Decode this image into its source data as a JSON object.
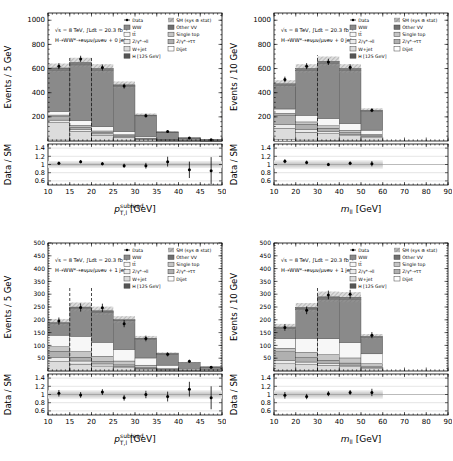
{
  "figure": {
    "background": "#ffffff",
    "ratio_ylabel": "Data / SM",
    "ratio_tick_labels": [
      "0.6",
      "0.8",
      "1",
      "1.2",
      "1.4"
    ],
    "legend": {
      "columns": [
        [
          {
            "label": "Data",
            "swatch": "marker"
          },
          {
            "label": "WW",
            "swatch": "#8a8a8a"
          },
          {
            "label": "tt̄",
            "swatch": "#f7f7f7"
          },
          {
            "label": "Z/γ*→ll",
            "swatch": "#ebebeb"
          },
          {
            "label": "W+jet",
            "swatch": "#dcdcdc"
          },
          {
            "label": "H [125 GeV]",
            "swatch": "#555555"
          }
        ],
        [
          {
            "label": "SM (sys ⊕ stat)",
            "swatch": "band"
          },
          {
            "label": "Other VV",
            "swatch": "#6f6f6f"
          },
          {
            "label": "Single top",
            "swatch": "#c6c6c6"
          },
          {
            "label": "Z/γ*→ττ",
            "swatch": "#b0b0b0"
          },
          {
            "label": "Dijet",
            "swatch": "#ffffff"
          }
        ]
      ]
    }
  },
  "chart_data": [
    {
      "id": "pt-sublead-0jet",
      "type": "bar",
      "title": "",
      "info_line1": "√s = 8 TeV,  ∫Ldt = 20.3 fb⁻¹",
      "info_line2": "H→WW*→eνμν/μνeν + 0 jets",
      "ylabel": "Events / 5 GeV",
      "xlabel": {
        "base": "p",
        "sup": "sublead",
        "sub": "T,l",
        "unit": "[GeV]"
      },
      "x": {
        "min": 10,
        "max": 50,
        "tick_labels": [
          10,
          15,
          20,
          25,
          30,
          35,
          40,
          45,
          50
        ],
        "minor_step": 1
      },
      "y": {
        "max": 1060,
        "tick_labels": [
          200,
          400,
          600,
          800,
          1000
        ],
        "minor_step": 40
      },
      "bin_edges": [
        10,
        15,
        20,
        25,
        30,
        35,
        40,
        45,
        50
      ],
      "stack": [
        {
          "name": "Dijet",
          "color": "#ffffff",
          "values": [
            8,
            5,
            4,
            3,
            1,
            0.5,
            0.3,
            0.2
          ]
        },
        {
          "name": "W+jet",
          "color": "#dcdcdc",
          "values": [
            145,
            75,
            45,
            28,
            12,
            5,
            2,
            1
          ]
        },
        {
          "name": "Z/γ*→ll",
          "color": "#ebebeb",
          "values": [
            20,
            15,
            10,
            6,
            3,
            1,
            0.5,
            0.2
          ]
        },
        {
          "name": "Z/γ*→ττ",
          "color": "#b0b0b0",
          "values": [
            30,
            20,
            12,
            8,
            4,
            1.5,
            0.7,
            0.3
          ]
        },
        {
          "name": "Single top",
          "color": "#c6c6c6",
          "values": [
            12,
            15,
            12,
            8,
            4,
            1.5,
            0.5,
            0.3
          ]
        },
        {
          "name": "tt̄",
          "color": "#f7f7f7",
          "values": [
            30,
            40,
            35,
            25,
            12,
            4,
            2,
            1
          ]
        },
        {
          "name": "WW",
          "color": "#8a8a8a",
          "values": [
            340,
            460,
            465,
            375,
            172,
            59,
            19,
            8.6
          ]
        },
        {
          "name": "Other VV",
          "color": "#6f6f6f",
          "values": [
            18,
            18,
            15,
            10,
            6,
            2,
            1,
            0.4
          ]
        },
        {
          "name": "H [125 GeV]",
          "color": "#555555",
          "values": [
            2,
            2,
            2,
            2,
            1,
            0.5,
            0,
            0
          ]
        }
      ],
      "sm_total": [
        605,
        650,
        600,
        465,
        215,
        75,
        26,
        12
      ],
      "band_frac": 0.06,
      "data": {
        "x": [
          12.5,
          17.5,
          22.5,
          27.5,
          32.5,
          37.5,
          42.5,
          47.5
        ],
        "y": [
          620,
          680,
          608,
          455,
          210,
          78,
          25,
          10
        ],
        "err": [
          25,
          26,
          25,
          21,
          15,
          9,
          5,
          3.2
        ]
      },
      "ratio": {
        "y": [
          1.03,
          1.07,
          1.02,
          0.97,
          0.97,
          1.07,
          0.87,
          0.85
        ],
        "err": [
          0.04,
          0.04,
          0.04,
          0.05,
          0.07,
          0.12,
          0.2,
          0.33
        ],
        "band": {
          "xmin": 10,
          "xmax": 50,
          "outer": 0.08,
          "inner": 0.04
        }
      },
      "cut_lines": [
        {
          "x": 15,
          "ytop": 700
        },
        {
          "x": 20,
          "ytop": 700
        }
      ]
    },
    {
      "id": "mll-0jet",
      "type": "bar",
      "title": "",
      "info_line1": "√s = 8 TeV,  ∫Ldt = 20.3 fb⁻¹",
      "info_line2": "H→WW*→eνμν/μνeν + 0 jets",
      "ylabel": "Events / 10 GeV",
      "xlabel": {
        "base": "m",
        "sub": "ll",
        "unit": "[GeV]"
      },
      "x": {
        "min": 10,
        "max": 90,
        "tick_labels": [
          10,
          20,
          30,
          40,
          50,
          60,
          70,
          80,
          90
        ],
        "minor_step": 2
      },
      "y": {
        "max": 1060,
        "tick_labels": [
          200,
          400,
          600,
          800,
          1000
        ],
        "minor_step": 40
      },
      "bin_edges": [
        10,
        20,
        30,
        40,
        50,
        60
      ],
      "stack": [
        {
          "name": "Dijet",
          "color": "#ffffff",
          "values": [
            10,
            8,
            6,
            4,
            2
          ]
        },
        {
          "name": "W+jet",
          "color": "#dcdcdc",
          "values": [
            95,
            65,
            55,
            40,
            25
          ]
        },
        {
          "name": "Z/γ*→ll",
          "color": "#ebebeb",
          "values": [
            30,
            25,
            20,
            12,
            8
          ]
        },
        {
          "name": "Z/γ*→ττ",
          "color": "#b0b0b0",
          "values": [
            80,
            40,
            25,
            15,
            8
          ]
        },
        {
          "name": "Single top",
          "color": "#c6c6c6",
          "values": [
            15,
            20,
            20,
            18,
            12
          ]
        },
        {
          "name": "tt̄",
          "color": "#f7f7f7",
          "values": [
            35,
            55,
            60,
            55,
            35
          ]
        },
        {
          "name": "WW",
          "color": "#8a8a8a",
          "values": [
            195,
            370,
            455,
            440,
            155
          ]
        },
        {
          "name": "Other VV",
          "color": "#6f6f6f",
          "values": [
            15,
            15,
            17,
            14,
            8
          ]
        },
        {
          "name": "H [125 GeV]",
          "color": "#555555",
          "values": [
            0,
            2,
            2,
            2,
            2
          ]
        }
      ],
      "sm_total": [
        475,
        600,
        660,
        600,
        255
      ],
      "band_frac": 0.06,
      "data": {
        "x": [
          15,
          25,
          35,
          45,
          55
        ],
        "y": [
          510,
          620,
          655,
          610,
          255
        ],
        "err": [
          23,
          25,
          26,
          25,
          16
        ]
      },
      "ratio": {
        "y": [
          1.08,
          1.05,
          1.0,
          1.03,
          1.02
        ],
        "err": [
          0.05,
          0.045,
          0.04,
          0.045,
          0.065
        ],
        "band": {
          "xmin": 10,
          "xmax": 60,
          "outer": 0.1,
          "inner": 0.05
        }
      },
      "cut_lines": [
        {
          "x": 30,
          "ytop": 710
        }
      ]
    },
    {
      "id": "pt-sublead-1jet",
      "type": "bar",
      "title": "",
      "info_line1": "√s = 8 TeV,  ∫Ldt = 20.3 fb⁻¹",
      "info_line2": "H→WW*→eνμν/μνeν + 1 jet",
      "ylabel": "Events / 5 GeV",
      "xlabel": {
        "base": "p",
        "sup": "sublead",
        "sub": "T,l",
        "unit": "[GeV]"
      },
      "x": {
        "min": 10,
        "max": 50,
        "tick_labels": [
          10,
          15,
          20,
          25,
          30,
          35,
          40,
          45,
          50
        ],
        "minor_step": 1
      },
      "y": {
        "max": 500,
        "tick_labels": [
          50,
          100,
          150,
          200,
          250,
          300,
          350,
          400,
          450,
          500
        ],
        "minor_step": 10
      },
      "bin_edges": [
        10,
        15,
        20,
        25,
        30,
        35,
        40,
        45,
        50
      ],
      "stack": [
        {
          "name": "Dijet",
          "color": "#ffffff",
          "values": [
            2,
            2,
            1.5,
            1,
            0.8,
            0.4,
            0.2,
            0.1
          ]
        },
        {
          "name": "W+jet",
          "color": "#dcdcdc",
          "values": [
            35,
            25,
            18,
            12,
            7,
            3,
            1.5,
            0.8
          ]
        },
        {
          "name": "Z/γ*→ll",
          "color": "#ebebeb",
          "values": [
            15,
            12,
            8,
            5,
            3,
            1,
            0.5,
            0.3
          ]
        },
        {
          "name": "Z/γ*→ττ",
          "color": "#b0b0b0",
          "values": [
            25,
            15,
            10,
            6,
            3,
            1.5,
            0.8,
            0.4
          ]
        },
        {
          "name": "Single top",
          "color": "#c6c6c6",
          "values": [
            18,
            22,
            20,
            15,
            9,
            4,
            2,
            1
          ]
        },
        {
          "name": "tt̄",
          "color": "#f7f7f7",
          "values": [
            45,
            60,
            55,
            45,
            28,
            13,
            6,
            3
          ]
        },
        {
          "name": "WW",
          "color": "#8a8a8a",
          "values": [
            45,
            108,
            117,
            112,
            74,
            43,
            21,
            10
          ]
        },
        {
          "name": "Other VV",
          "color": "#6f6f6f",
          "values": [
            5,
            5,
            5,
            3,
            2.5,
            1.6,
            1,
            0.4
          ]
        },
        {
          "name": "H [125 GeV]",
          "color": "#555555",
          "values": [
            0,
            1,
            0.5,
            1,
            0.7,
            0.5,
            0,
            0
          ]
        }
      ],
      "sm_total": [
        190,
        250,
        235,
        200,
        128,
        68,
        33,
        16
      ],
      "band_frac": 0.07,
      "data": {
        "x": [
          12.5,
          17.5,
          22.5,
          27.5,
          32.5,
          37.5,
          42.5,
          47.5
        ],
        "y": [
          195,
          248,
          247,
          185,
          127,
          65,
          38,
          15
        ],
        "err": [
          14,
          16,
          16,
          14,
          11,
          8,
          6,
          4
        ]
      },
      "ratio": {
        "y": [
          1.03,
          0.99,
          1.06,
          0.92,
          1.0,
          0.95,
          1.13,
          0.92
        ],
        "err": [
          0.08,
          0.07,
          0.07,
          0.07,
          0.09,
          0.12,
          0.18,
          0.28
        ],
        "band": {
          "xmin": 10,
          "xmax": 50,
          "outer": 0.1,
          "inner": 0.05
        }
      },
      "cut_lines": [
        {
          "x": 15,
          "ytop": 325
        },
        {
          "x": 20,
          "ytop": 325
        }
      ]
    },
    {
      "id": "mll-1jet",
      "type": "bar",
      "title": "",
      "info_line1": "√s = 8 TeV,  ∫Ldt = 20.3 fb⁻¹",
      "info_line2": "H→WW*→eνμν/μνeν + 1 jet",
      "ylabel": "Events / 10 GeV",
      "xlabel": {
        "base": "m",
        "sub": "ll",
        "unit": "[GeV]"
      },
      "x": {
        "min": 10,
        "max": 90,
        "tick_labels": [
          10,
          20,
          30,
          40,
          50,
          60,
          70,
          80,
          90
        ],
        "minor_step": 2
      },
      "y": {
        "max": 500,
        "tick_labels": [
          50,
          100,
          150,
          200,
          250,
          300,
          350,
          400,
          450,
          500
        ],
        "minor_step": 10
      },
      "bin_edges": [
        10,
        20,
        30,
        40,
        50,
        60
      ],
      "stack": [
        {
          "name": "Dijet",
          "color": "#ffffff",
          "values": [
            3,
            3,
            2,
            2,
            1
          ]
        },
        {
          "name": "W+jet",
          "color": "#dcdcdc",
          "values": [
            25,
            22,
            20,
            15,
            8
          ]
        },
        {
          "name": "Z/γ*→ll",
          "color": "#ebebeb",
          "values": [
            12,
            10,
            8,
            6,
            4
          ]
        },
        {
          "name": "Z/γ*→ττ",
          "color": "#b0b0b0",
          "values": [
            35,
            18,
            12,
            8,
            4
          ]
        },
        {
          "name": "Single top",
          "color": "#c6c6c6",
          "values": [
            14,
            20,
            22,
            20,
            12
          ]
        },
        {
          "name": "tt̄",
          "color": "#f7f7f7",
          "values": [
            38,
            55,
            62,
            60,
            38
          ]
        },
        {
          "name": "WW",
          "color": "#8a8a8a",
          "values": [
            40,
            112,
            155,
            168,
            64
          ]
        },
        {
          "name": "Other VV",
          "color": "#6f6f6f",
          "values": [
            5,
            6,
            7,
            7,
            3
          ]
        },
        {
          "name": "H [125 GeV]",
          "color": "#555555",
          "values": [
            0,
            2,
            2,
            2,
            1
          ]
        }
      ],
      "sm_total": [
        172,
        248,
        290,
        288,
        135
      ],
      "band_frac": 0.07,
      "data": {
        "x": [
          15,
          25,
          35,
          45,
          55
        ],
        "y": [
          170,
          237,
          297,
          300,
          140
        ],
        "err": [
          13,
          15,
          17,
          17,
          12
        ]
      },
      "ratio": {
        "y": [
          0.98,
          0.95,
          1.02,
          1.05,
          1.05
        ],
        "err": [
          0.08,
          0.065,
          0.06,
          0.06,
          0.09
        ],
        "band": {
          "xmin": 10,
          "xmax": 60,
          "outer": 0.1,
          "inner": 0.05
        }
      },
      "cut_lines": [
        {
          "x": 30,
          "ytop": 325
        }
      ]
    }
  ]
}
